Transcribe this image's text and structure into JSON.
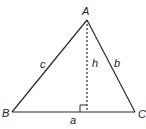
{
  "diagram": {
    "type": "triangle-with-altitude",
    "colors": {
      "line": "#2a2a2a",
      "background": "#ffffff"
    },
    "vertices": {
      "A": {
        "label": "A",
        "x": 87,
        "y": 20
      },
      "B": {
        "label": "B",
        "x": 12,
        "y": 112
      },
      "C": {
        "label": "C",
        "x": 135,
        "y": 112
      }
    },
    "sides": {
      "a": {
        "label": "a",
        "between": "B-C"
      },
      "b": {
        "label": "b",
        "between": "A-C"
      },
      "c": {
        "label": "c",
        "between": "A-B"
      }
    },
    "altitude": {
      "label": "h",
      "from": "A",
      "foot_x": 87,
      "foot_y": 112,
      "style": "dashed",
      "right_angle_marker": true
    }
  }
}
